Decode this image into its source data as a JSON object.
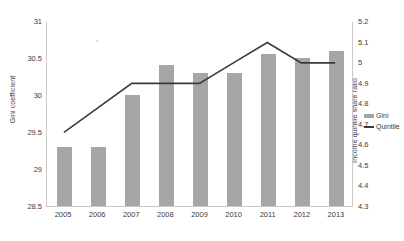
{
  "chart_data": {
    "type": "bar",
    "title": "",
    "subtitle": "",
    "xlabel": "",
    "ylabel": "Gini coefficient",
    "y2label": "Income quintile share ratio",
    "categories": [
      "2005",
      "2006",
      "2007",
      "2008",
      "2009",
      "2010",
      "2011",
      "2012",
      "2013"
    ],
    "ylim": [
      28.5,
      31.0
    ],
    "y2lim": [
      4.3,
      5.2
    ],
    "yticks": [
      "28.5",
      "29",
      "29.5",
      "30",
      "30.5",
      "31"
    ],
    "y2ticks": [
      "4.3",
      "4.4",
      "4.5",
      "4.6",
      "4.7",
      "4.8",
      "4.9",
      "5",
      "5.1",
      "5.2"
    ],
    "grid": false,
    "legend_position": "right",
    "series": [
      {
        "name": "Gini",
        "type": "bar",
        "axis": "left",
        "color": "#a6a6a6",
        "values": [
          29.3,
          29.3,
          30.0,
          30.4,
          30.3,
          30.3,
          30.55,
          30.5,
          30.6
        ]
      },
      {
        "name": "Quintile",
        "type": "line",
        "axis": "right",
        "color": "#3a3a3a",
        "values": [
          4.66,
          4.78,
          4.9,
          4.9,
          4.9,
          5.0,
          5.1,
          5.0,
          5.0
        ]
      }
    ]
  },
  "axes": {
    "left_title": "Gini coefficient",
    "right_title": "Income quintile share ratio"
  },
  "legend": {
    "items": [
      {
        "label": "Gini"
      },
      {
        "label": "Quintile"
      }
    ]
  }
}
